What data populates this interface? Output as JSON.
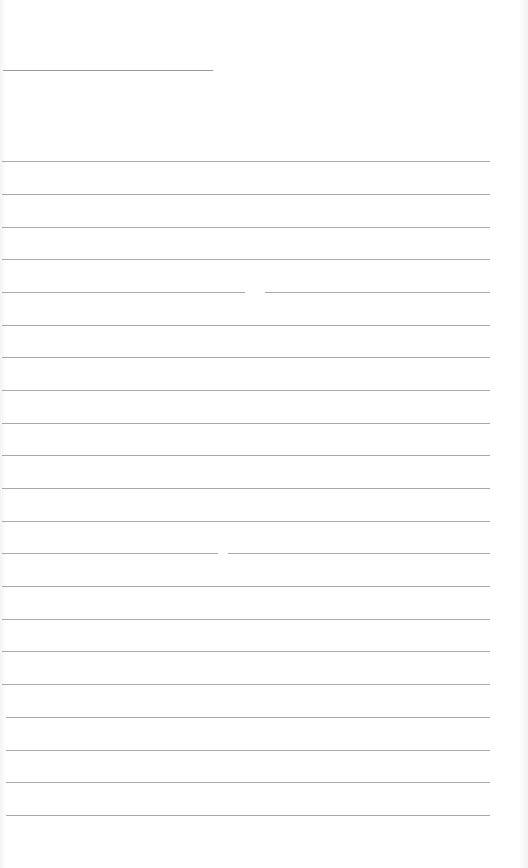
{
  "page": {
    "type": "blank lined paper",
    "background_color": "#ffffff",
    "line_color": "#a9a9a9"
  },
  "header_line": {
    "y": 70,
    "x_start": 3,
    "x_end": 213
  },
  "ruled_lines": [
    {
      "y": 161,
      "x_start": 2,
      "x_end": 490
    },
    {
      "y": 194,
      "x_start": 2,
      "x_end": 490
    },
    {
      "y": 227,
      "x_start": 2,
      "x_end": 490
    },
    {
      "y": 259,
      "x_start": 2,
      "x_end": 490
    },
    {
      "y": 292,
      "x_start": 2,
      "x_end": 490,
      "gap": [
        245,
        265
      ]
    },
    {
      "y": 325,
      "x_start": 2,
      "x_end": 490
    },
    {
      "y": 357,
      "x_start": 2,
      "x_end": 490
    },
    {
      "y": 390,
      "x_start": 2,
      "x_end": 490
    },
    {
      "y": 423,
      "x_start": 2,
      "x_end": 490
    },
    {
      "y": 455,
      "x_start": 2,
      "x_end": 490
    },
    {
      "y": 488,
      "x_start": 2,
      "x_end": 490
    },
    {
      "y": 521,
      "x_start": 2,
      "x_end": 490
    },
    {
      "y": 553,
      "x_start": 2,
      "x_end": 490,
      "gap": [
        218,
        228
      ]
    },
    {
      "y": 586,
      "x_start": 2,
      "x_end": 490
    },
    {
      "y": 619,
      "x_start": 2,
      "x_end": 490
    },
    {
      "y": 651,
      "x_start": 2,
      "x_end": 490
    },
    {
      "y": 684,
      "x_start": 2,
      "x_end": 490
    },
    {
      "y": 717,
      "x_start": 6,
      "x_end": 490
    },
    {
      "y": 750,
      "x_start": 6,
      "x_end": 490
    },
    {
      "y": 782,
      "x_start": 6,
      "x_end": 490
    },
    {
      "y": 815,
      "x_start": 6,
      "x_end": 490
    }
  ]
}
